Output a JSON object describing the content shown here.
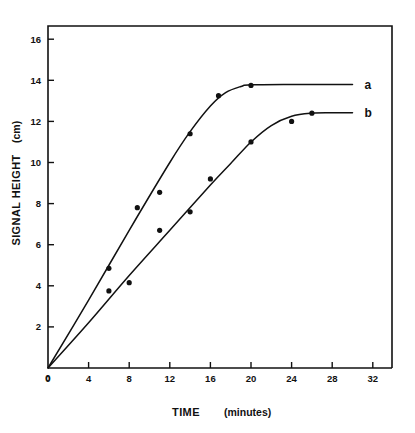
{
  "chart_data": {
    "type": "line",
    "title": "",
    "xlabel": "TIME (minutes)",
    "xlabel_main": "TIME",
    "xlabel_unit": "(minutes)",
    "ylabel": "SIGNAL HEIGHT (cm)",
    "ylabel_main": "SIGNAL HEIGHT",
    "ylabel_unit": "(cm)",
    "xlim": [
      0,
      34
    ],
    "ylim": [
      0,
      17
    ],
    "xticks": [
      0,
      4,
      8,
      12,
      16,
      20,
      24,
      28,
      32
    ],
    "yticks": [
      0,
      2,
      4,
      6,
      8,
      10,
      12,
      14,
      16
    ],
    "xtick_labels": [
      "0",
      "4",
      "8",
      "12",
      "16",
      "20",
      "24",
      "28",
      "32"
    ],
    "ytick_labels": [
      "0",
      "2",
      "4",
      "6",
      "8",
      "10",
      "12",
      "14",
      "16"
    ],
    "grid": false,
    "legend_position": "right-of-curve-ends",
    "marker": "filled-circle",
    "line_color": "#111111",
    "marker_color": "#111111",
    "background_color": "#ffffff",
    "series": [
      {
        "name": "a",
        "label": "a",
        "plateau_value": 13.8,
        "points": [
          {
            "x": 0,
            "y": 0
          },
          {
            "x": 6,
            "y": 4.85
          },
          {
            "x": 8.8,
            "y": 7.8
          },
          {
            "x": 11,
            "y": 8.55
          },
          {
            "x": 14,
            "y": 11.4
          },
          {
            "x": 16.8,
            "y": 13.25
          },
          {
            "x": 20,
            "y": 13.75
          }
        ],
        "curve": [
          {
            "x": 0,
            "y": 0
          },
          {
            "x": 4,
            "y": 3.3
          },
          {
            "x": 8,
            "y": 6.7
          },
          {
            "x": 12,
            "y": 10.0
          },
          {
            "x": 14,
            "y": 11.5
          },
          {
            "x": 16,
            "y": 12.75
          },
          {
            "x": 17.5,
            "y": 13.4
          },
          {
            "x": 19,
            "y": 13.7
          },
          {
            "x": 20,
            "y": 13.78
          },
          {
            "x": 24,
            "y": 13.8
          },
          {
            "x": 28,
            "y": 13.8
          },
          {
            "x": 30,
            "y": 13.8
          }
        ]
      },
      {
        "name": "b",
        "label": "b",
        "plateau_value": 12.4,
        "points": [
          {
            "x": 0,
            "y": 0
          },
          {
            "x": 6,
            "y": 3.75
          },
          {
            "x": 8,
            "y": 4.15
          },
          {
            "x": 11,
            "y": 6.7
          },
          {
            "x": 14,
            "y": 7.6
          },
          {
            "x": 16,
            "y": 9.2
          },
          {
            "x": 20,
            "y": 11.0
          },
          {
            "x": 24,
            "y": 12.0
          },
          {
            "x": 26,
            "y": 12.4
          }
        ],
        "curve": [
          {
            "x": 0,
            "y": 0
          },
          {
            "x": 4,
            "y": 2.2
          },
          {
            "x": 8,
            "y": 4.5
          },
          {
            "x": 12,
            "y": 6.7
          },
          {
            "x": 16,
            "y": 8.9
          },
          {
            "x": 18,
            "y": 9.95
          },
          {
            "x": 20,
            "y": 11.0
          },
          {
            "x": 22,
            "y": 11.8
          },
          {
            "x": 24,
            "y": 12.25
          },
          {
            "x": 26,
            "y": 12.4
          },
          {
            "x": 28,
            "y": 12.42
          },
          {
            "x": 30,
            "y": 12.42
          }
        ]
      }
    ]
  }
}
